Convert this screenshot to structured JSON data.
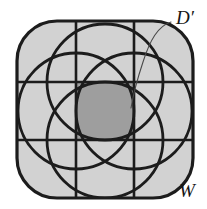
{
  "figure": {
    "canvas": {
      "width": 207,
      "height": 209,
      "background": "#ffffff"
    },
    "outer_shape": {
      "name": "rounded-square",
      "x": 17,
      "y": 21,
      "width": 176,
      "height": 177,
      "corner_radius": 40,
      "fill": "#d2d2d2",
      "stroke": "#1c1c1c",
      "stroke_width": 3.2
    },
    "grid": {
      "vertical_lines_x": [
        76,
        134
      ],
      "horizontal_lines_y": [
        82,
        140
      ],
      "stroke": "#1c1c1c",
      "stroke_width": 2.6
    },
    "central_cell": {
      "x": 76,
      "y": 82,
      "width": 58,
      "height": 58,
      "fill": "#9e9e9e"
    },
    "circles": [
      {
        "name": "circle-top",
        "cx": 105,
        "cy": 82,
        "r": 58
      },
      {
        "name": "circle-bottom",
        "cx": 105,
        "cy": 140,
        "r": 58
      },
      {
        "name": "circle-left",
        "cx": 76,
        "cy": 111,
        "r": 58
      },
      {
        "name": "circle-right",
        "cx": 134,
        "cy": 111,
        "r": 58
      }
    ],
    "circle_style": {
      "stroke": "#1c1c1c",
      "stroke_width": 2.8,
      "fill": "none"
    },
    "leader_line": {
      "name": "leader-line-d-prime",
      "path": "M 171 22 C 158 26 150 40 143 62 C 137 80 133 96 131 108",
      "stroke": "#4a4a4a",
      "stroke_width": 1.1
    },
    "labels": [
      {
        "name": "label-d-prime",
        "text": "D′",
        "x": 176,
        "y": 24,
        "font_size": 19,
        "color": "#151515"
      },
      {
        "name": "label-w",
        "text": "W",
        "x": 179,
        "y": 197,
        "font_size": 19,
        "color": "#151515"
      }
    ],
    "colors": {
      "outer_fill": "#d2d2d2",
      "center_fill": "#9e9e9e",
      "stroke": "#1c1c1c",
      "leader": "#4a4a4a",
      "background": "#ffffff"
    }
  }
}
